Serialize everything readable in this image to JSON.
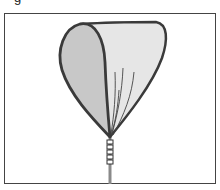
{
  "figure": {
    "caption_fragment": "g",
    "colors": {
      "outline": "#3a3a3a",
      "sepal_fill": "#c9c9c9",
      "petal_fill": "#e4e4e4",
      "frame": "#444444",
      "background": "#ffffff"
    }
  }
}
